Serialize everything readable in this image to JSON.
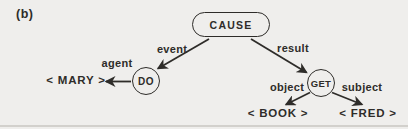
{
  "figure": {
    "panel_label": "(b)",
    "nodes": {
      "cause": {
        "label": "CAUSE",
        "shape": "stadium"
      },
      "do": {
        "label": "DO",
        "shape": "circle"
      },
      "get": {
        "label": "GET",
        "shape": "circle"
      }
    },
    "edges": {
      "event": {
        "label": "event",
        "from": "CAUSE",
        "to": "DO"
      },
      "result": {
        "label": "result",
        "from": "CAUSE",
        "to": "GET"
      },
      "agent": {
        "label": "agent",
        "from": "DO",
        "to": "< MARY >"
      },
      "object": {
        "label": "object",
        "from": "GET",
        "to": "< BOOK >"
      },
      "subject": {
        "label": "subject",
        "from": "GET",
        "to": "< FRED >"
      }
    },
    "terminals": {
      "mary": {
        "label": "< MARY >"
      },
      "book": {
        "label": "< BOOK >"
      },
      "fred": {
        "label": "< FRED >"
      }
    },
    "colors": {
      "ink": "#2e2c29",
      "paper": "#efeeec"
    }
  }
}
